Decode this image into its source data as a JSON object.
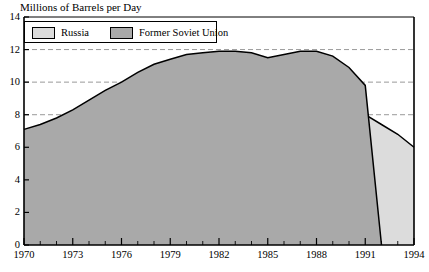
{
  "chart_data": {
    "type": "area",
    "title": "",
    "ylabel": "Millions of Barrels per Day",
    "xlabel": "",
    "ylim": [
      0,
      14
    ],
    "xlim": [
      1970,
      1994
    ],
    "yticks": [
      0,
      2,
      4,
      6,
      8,
      10,
      12,
      14
    ],
    "xticks": [
      1970,
      1973,
      1976,
      1979,
      1982,
      1985,
      1988,
      1991,
      1994
    ],
    "xtick_minor_step": 1,
    "grid": "horizontal-dashed",
    "legend_position": "top-left-inside",
    "stacked": false,
    "x": [
      1970,
      1971,
      1972,
      1973,
      1974,
      1975,
      1976,
      1977,
      1978,
      1979,
      1980,
      1981,
      1982,
      1983,
      1984,
      1985,
      1986,
      1987,
      1988,
      1989,
      1990,
      1991,
      1992,
      1993,
      1994
    ],
    "series": [
      {
        "name": "Former Soviet Union",
        "color": "#a9a9a9",
        "values": [
          7.1,
          7.4,
          7.8,
          8.3,
          8.9,
          9.5,
          10.0,
          10.6,
          11.1,
          11.4,
          11.7,
          11.8,
          11.9,
          11.9,
          11.8,
          11.5,
          11.7,
          11.9,
          11.9,
          11.6,
          10.9,
          9.8,
          0,
          null,
          null
        ]
      },
      {
        "name": "Russia",
        "color": "#dcdcdc",
        "values": [
          null,
          null,
          null,
          null,
          null,
          null,
          null,
          null,
          null,
          null,
          null,
          null,
          null,
          null,
          null,
          null,
          null,
          null,
          null,
          null,
          null,
          8.0,
          7.4,
          6.8,
          6.0
        ]
      }
    ],
    "annotations": [
      "Former Soviet Union production rises from about 7.1 in 1970 to a plateau near 11.9 in 1982-1988, dips near 11.5 in 1985, then falls sharply after 1988 and terminates at 1991.",
      "Russia series begins at about 8.0 in 1991 and declines to about 6.0 in 1994."
    ]
  },
  "legend": {
    "items": [
      {
        "label": "Russia",
        "swatch": "russia-swatch"
      },
      {
        "label": "Former Soviet Union",
        "swatch": "fsu-swatch"
      }
    ]
  },
  "axes": {
    "y_title": "Millions of Barrels per Day",
    "y_labels": [
      "14",
      "12",
      "10",
      "8",
      "6",
      "4",
      "2",
      "0"
    ],
    "x_labels": [
      "1970",
      "1973",
      "1976",
      "1979",
      "1982",
      "1985",
      "1988",
      "1991",
      "1994"
    ]
  },
  "colors": {
    "russia": "#dcdcdc",
    "former_soviet_union": "#a9a9a9",
    "axis": "#000000",
    "grid": "#808080",
    "background": "#ffffff"
  }
}
